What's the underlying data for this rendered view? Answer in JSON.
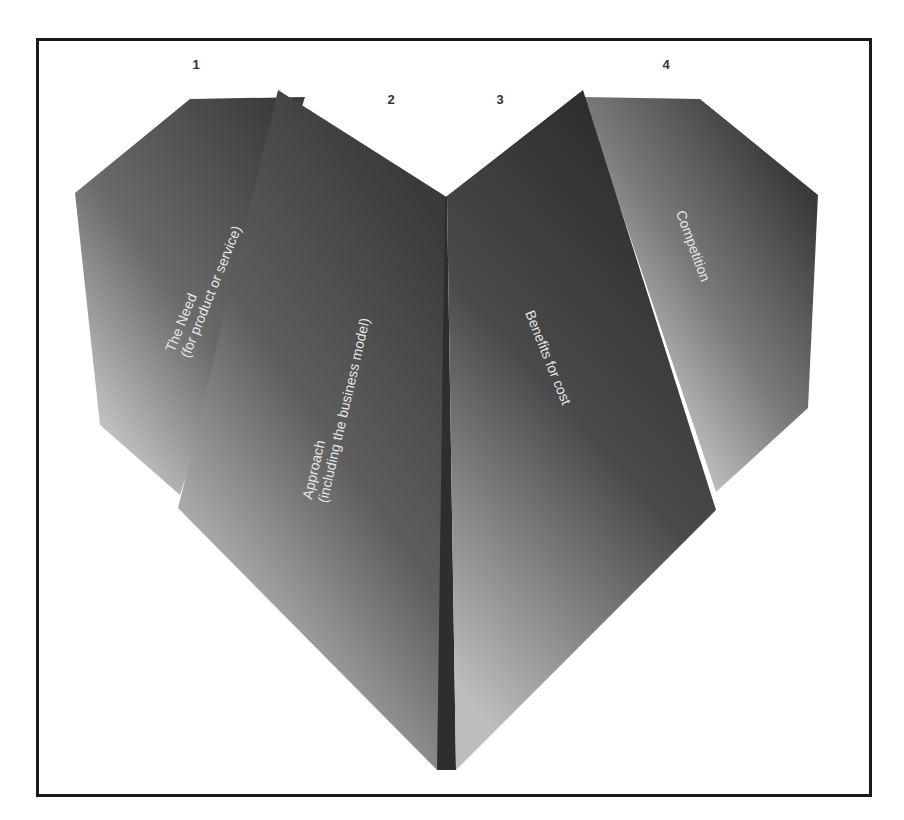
{
  "diagram": {
    "type": "heart-of-four-folded-panels",
    "panels": [
      {
        "number": "1",
        "title": "The Need",
        "subtitle": "(for product or service)"
      },
      {
        "number": "2",
        "title": "Approach",
        "subtitle": "(including the business model)"
      },
      {
        "number": "3",
        "title": "Benefits for cost",
        "subtitle": ""
      },
      {
        "number": "4",
        "title": "Competition",
        "subtitle": ""
      }
    ],
    "colors": {
      "frame_border": "#1a1a1a",
      "number_text": "#333333",
      "label_text": "#e6e6e6",
      "panel_dark": "#3a3a3a",
      "panel_light": "#c8c8c8",
      "seam": "#2e2e2e"
    }
  }
}
